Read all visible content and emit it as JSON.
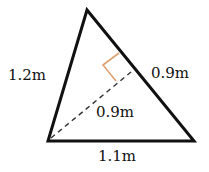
{
  "diagram": {
    "type": "triangle-with-altitude",
    "colors": {
      "stroke": "#111111",
      "right_angle_marker": "#e0a070",
      "background": "#ffffff"
    },
    "vertices": {
      "apex": [
        87,
        10
      ],
      "bottom_left": [
        48,
        141
      ],
      "bottom_right": [
        194,
        141
      ]
    },
    "labels": {
      "left_side": "1.2m",
      "right_side": "0.9m",
      "altitude": "0.9m",
      "base": "1.1m"
    }
  }
}
